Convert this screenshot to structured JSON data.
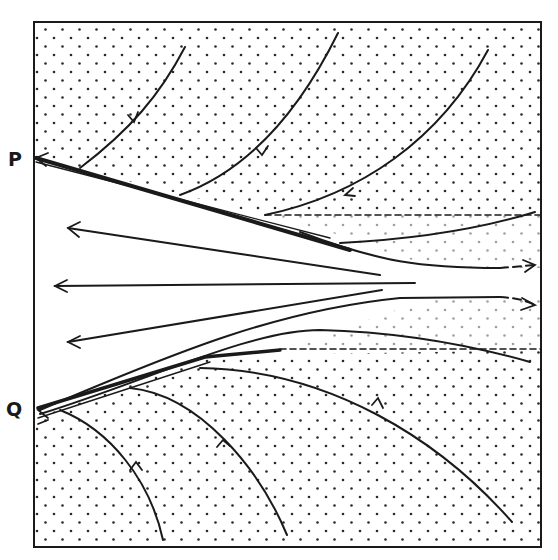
{
  "figure": {
    "type": "phase-portrait",
    "labels": {
      "p": "P",
      "q": "Q"
    },
    "colors": {
      "ink": "#1a1a1a",
      "background": "#ffffff",
      "stipple": "#2a2a2a"
    },
    "frame": {
      "x": 34,
      "y": 22,
      "width": 507,
      "height": 525
    },
    "points": {
      "P": {
        "x": 34,
        "y": 158
      },
      "Q": {
        "x": 36,
        "y": 410
      }
    },
    "regions": [
      {
        "name": "upper-stippled-region",
        "shaded": true
      },
      {
        "name": "central-wedge",
        "shaded": false
      },
      {
        "name": "lower-stippled-region",
        "shaded": true
      }
    ],
    "trajectories": {
      "upper_into_P": 3,
      "lower_into_Q": 3,
      "central_wedge_arrows_pointing_left": 3,
      "right_side_dashed_exits": 2,
      "horizontal_dashed_boundaries": 2
    }
  }
}
